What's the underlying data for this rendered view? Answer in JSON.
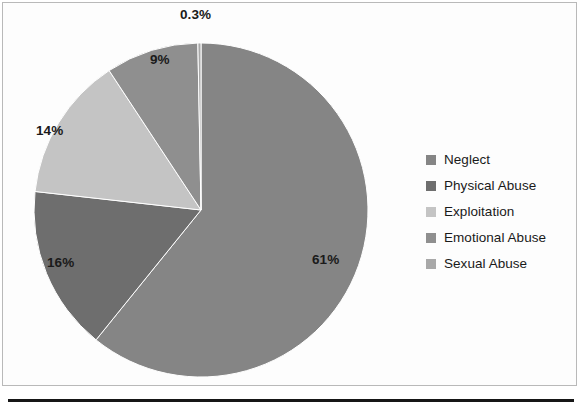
{
  "chart_data": {
    "type": "pie",
    "title": "",
    "subtitle": "",
    "xlabel": "",
    "ylabel": "",
    "grid": false,
    "legend_position": "right",
    "start_angle_deg": 0,
    "direction": "clockwise",
    "categories": [
      "Neglect",
      "Physical Abuse",
      "Exploitation",
      "Emotional Abuse",
      "Sexual Abuse"
    ],
    "values": [
      61,
      16,
      14,
      9,
      0.3
    ],
    "value_labels": [
      "61%",
      "16%",
      "14%",
      "9%",
      "0.3%"
    ],
    "colors": [
      "#858585",
      "#6e6e6e",
      "#c4c4c4",
      "#8f8f8f",
      "#a8a8a8"
    ],
    "slices": [
      {
        "label": "Neglect",
        "value": 61,
        "value_label": "61%",
        "color": "#858585",
        "label_x": 312,
        "label_y": 252
      },
      {
        "label": "Physical Abuse",
        "value": 16,
        "value_label": "16%",
        "color": "#6e6e6e",
        "label_x": 47,
        "label_y": 255
      },
      {
        "label": "Exploitation",
        "value": 14,
        "value_label": "14%",
        "color": "#c4c4c4",
        "label_x": 36,
        "label_y": 123
      },
      {
        "label": "Emotional Abuse",
        "value": 9,
        "value_label": "9%",
        "color": "#8f8f8f",
        "label_x": 150,
        "label_y": 52
      },
      {
        "label": "Sexual Abuse",
        "value": 0.3,
        "value_label": "0.3%",
        "color": "#a8a8a8",
        "label_x": 180,
        "label_y": 7
      }
    ]
  },
  "legend": {
    "items": [
      {
        "label": "Neglect",
        "color": "#858585"
      },
      {
        "label": "Physical Abuse",
        "color": "#6e6e6e"
      },
      {
        "label": "Exploitation",
        "color": "#c4c4c4"
      },
      {
        "label": "Emotional Abuse",
        "color": "#8f8f8f"
      },
      {
        "label": "Sexual Abuse",
        "color": "#a8a8a8"
      }
    ]
  }
}
